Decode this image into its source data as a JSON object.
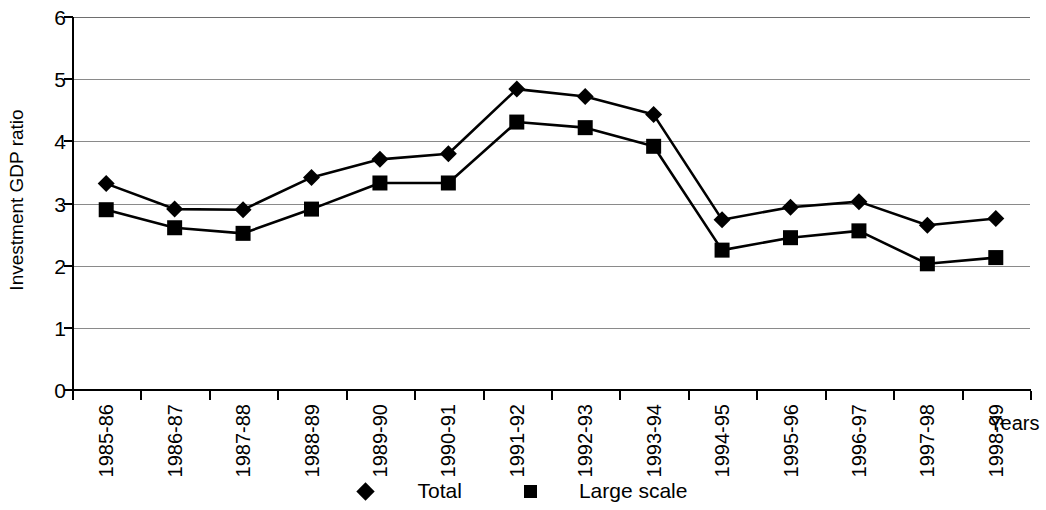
{
  "chart_data": {
    "type": "line",
    "title": "",
    "xlabel": "Years",
    "ylabel": "Investment GDP ratio",
    "categories": [
      "1985-86",
      "1986-87",
      "1987-88",
      "1988-89",
      "1989-90",
      "1990-91",
      "1991-92",
      "1992-93",
      "1993-94",
      "1994-95",
      "1995-96",
      "1996-97",
      "1997-98",
      "1998-99"
    ],
    "series": [
      {
        "name": "Total",
        "marker": "diamond",
        "color": "#000000",
        "values": [
          3.32,
          2.91,
          2.9,
          3.42,
          3.71,
          3.8,
          4.84,
          4.72,
          4.43,
          2.74,
          2.94,
          3.03,
          2.65,
          2.76
        ]
      },
      {
        "name": "Large scale",
        "marker": "square",
        "color": "#000000",
        "values": [
          2.9,
          2.61,
          2.52,
          2.91,
          3.33,
          3.33,
          4.31,
          4.22,
          3.92,
          2.25,
          2.45,
          2.56,
          2.03,
          2.13
        ]
      }
    ],
    "ylim": [
      0,
      6
    ],
    "yticks": [
      0,
      1,
      2,
      3,
      4,
      5,
      6
    ],
    "ytick_labels": [
      "0",
      "1",
      "2",
      "3",
      "4",
      "5",
      "6"
    ],
    "grid": true,
    "grid_axis": "y",
    "legend_position": "bottom",
    "xtick_rotation": 90
  }
}
